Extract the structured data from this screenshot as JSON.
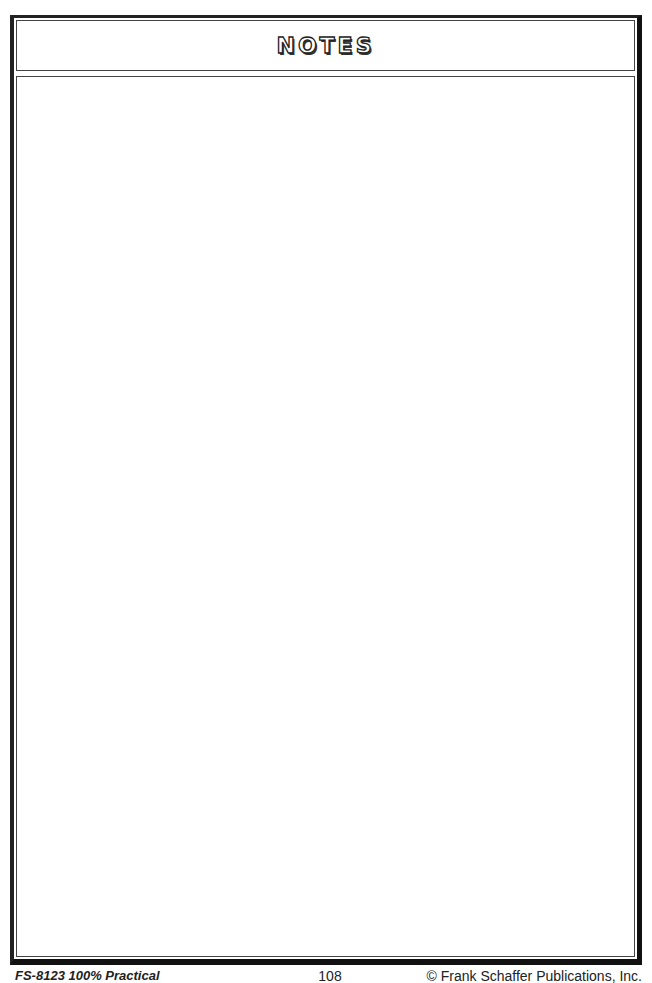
{
  "page": {
    "title": "NOTES",
    "notes_area": ""
  },
  "footer": {
    "product_code": "FS-8123 100% Practical",
    "page_number": "108",
    "copyright": "© Frank Schaffer Publications, Inc."
  },
  "colors": {
    "border": "#111111",
    "background": "#ffffff"
  }
}
